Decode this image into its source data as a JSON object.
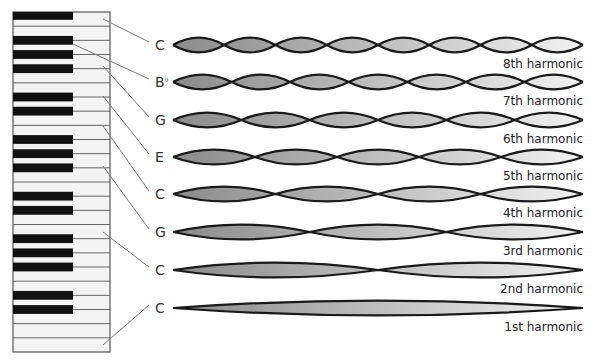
{
  "diagram": {
    "title": "",
    "keyboard": {
      "white_key_count": 24,
      "black_key_groups": "piano keys shown vertically, black keys on left side"
    },
    "rows": [
      {
        "note": "C",
        "note_accidental": "",
        "harmonic": 8,
        "label": "8th harmonic"
      },
      {
        "note": "B",
        "note_accidental": "♭",
        "harmonic": 7,
        "label": "7th harmonic"
      },
      {
        "note": "G",
        "note_accidental": "",
        "harmonic": 6,
        "label": "6th harmonic"
      },
      {
        "note": "E",
        "note_accidental": "",
        "harmonic": 5,
        "label": "5th harmonic"
      },
      {
        "note": "C",
        "note_accidental": "",
        "harmonic": 4,
        "label": "4th harmonic"
      },
      {
        "note": "G",
        "note_accidental": "",
        "harmonic": 3,
        "label": "3rd harmonic"
      },
      {
        "note": "C",
        "note_accidental": "",
        "harmonic": 2,
        "label": "2nd harmonic"
      },
      {
        "note": "C",
        "note_accidental": "",
        "harmonic": 1,
        "label": "1st harmonic"
      }
    ],
    "colors": {
      "wave_stroke": "#1a1a1a",
      "wave_fill_dark": "#8a8a8a",
      "wave_fill_light": "#f2f2f2",
      "black_key": "#111111",
      "white_key": "#f4f4f4",
      "connector": "#777777"
    }
  }
}
